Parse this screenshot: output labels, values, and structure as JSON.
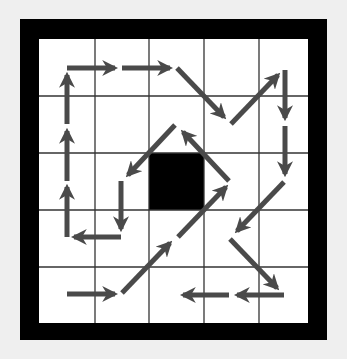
{
  "diagram": {
    "type": "grid-arrow-path",
    "rows": 5,
    "cols": 5,
    "colors": {
      "background": "#efefef",
      "frame": "#000000",
      "cell": "#ffffff",
      "grid_line": "#333333",
      "blocked_cell": "#000000",
      "arrow": "#4a4a4a"
    },
    "grid": {
      "x_lines": [
        39,
        95,
        149,
        204,
        259,
        308
      ],
      "y_lines": [
        39,
        96,
        153,
        210,
        267,
        323
      ]
    },
    "blocked_cells": [
      {
        "row": 2,
        "col": 2
      }
    ],
    "arrows": [
      {
        "name": "arrow-right-r4c0",
        "x1": 67,
        "y1": 294,
        "x2": 115,
        "y2": 294
      },
      {
        "name": "arrow-upright-r4c1-r3c2",
        "x1": 122,
        "y1": 293,
        "x2": 170,
        "y2": 243
      },
      {
        "name": "arrow-upright-r3c2-r2c3",
        "x1": 178,
        "y1": 237,
        "x2": 226,
        "y2": 187
      },
      {
        "name": "arrow-upleft-r2c3-r1c3",
        "x1": 229,
        "y1": 181,
        "x2": 183,
        "y2": 132
      },
      {
        "name": "arrow-downleft-r1c2-r2c1",
        "x1": 175,
        "y1": 125,
        "x2": 128,
        "y2": 175
      },
      {
        "name": "arrow-down-r2c1-r3c1",
        "x1": 121,
        "y1": 181,
        "x2": 121,
        "y2": 229
      },
      {
        "name": "arrow-left-r3c1-r3c0",
        "x1": 121,
        "y1": 237,
        "x2": 74,
        "y2": 237
      },
      {
        "name": "arrow-up-r3c0-r2c0",
        "x1": 67,
        "y1": 237,
        "x2": 67,
        "y2": 187
      },
      {
        "name": "arrow-up-r2c0-r1c0",
        "x1": 67,
        "y1": 181,
        "x2": 67,
        "y2": 131
      },
      {
        "name": "arrow-up-r1c0-r0c0",
        "x1": 67,
        "y1": 124,
        "x2": 67,
        "y2": 75
      },
      {
        "name": "arrow-right-r0c0-r0c1",
        "x1": 67,
        "y1": 68,
        "x2": 115,
        "y2": 68
      },
      {
        "name": "arrow-right-r0c1-r0c2",
        "x1": 122,
        "y1": 68,
        "x2": 170,
        "y2": 68
      },
      {
        "name": "arrow-downright-r0c2-r1c3",
        "x1": 177,
        "y1": 68,
        "x2": 224,
        "y2": 117
      },
      {
        "name": "arrow-upright-r1c3-r0c4",
        "x1": 231,
        "y1": 124,
        "x2": 278,
        "y2": 75
      },
      {
        "name": "arrow-down-r0c4-r1c4",
        "x1": 285,
        "y1": 70,
        "x2": 285,
        "y2": 118
      },
      {
        "name": "arrow-down-r1c4-r2c4",
        "x1": 285,
        "y1": 126,
        "x2": 285,
        "y2": 174
      },
      {
        "name": "arrow-downleft-r2c4-r3c3",
        "x1": 284,
        "y1": 182,
        "x2": 237,
        "y2": 231
      },
      {
        "name": "arrow-downright-r3c3-r4c4",
        "x1": 230,
        "y1": 239,
        "x2": 277,
        "y2": 288
      },
      {
        "name": "arrow-left-r4c4-r4c3",
        "x1": 284,
        "y1": 295,
        "x2": 237,
        "y2": 295
      },
      {
        "name": "arrow-left-r4c3-r4c2",
        "x1": 229,
        "y1": 295,
        "x2": 183,
        "y2": 295
      }
    ]
  }
}
